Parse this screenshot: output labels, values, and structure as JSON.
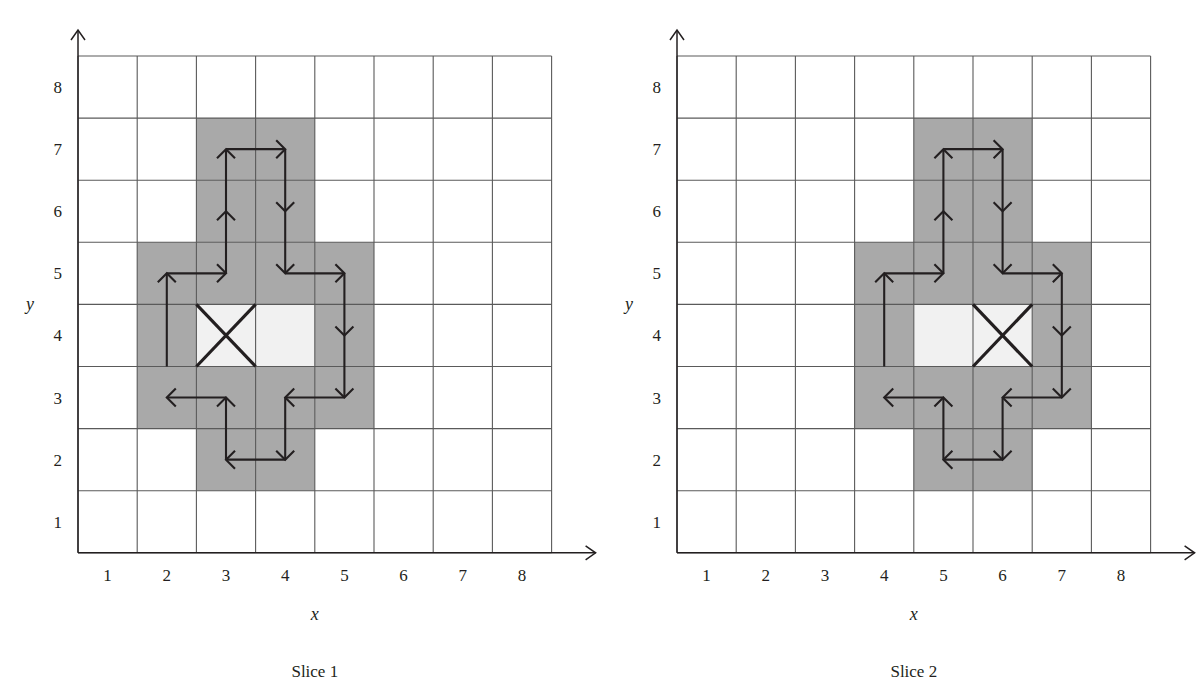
{
  "figure": {
    "background": "#ffffff",
    "ink": "#231f20",
    "shaded_color": "#a9a9a9",
    "light_color": "#f1f1f1",
    "grid_line_color": "#5a5a5a"
  },
  "panels": [
    {
      "id": "slice-1",
      "caption": "Slice 1",
      "axis": {
        "x_label": "x",
        "y_label": "y",
        "x_ticks": [
          "1",
          "2",
          "3",
          "4",
          "5",
          "6",
          "7",
          "8"
        ],
        "y_ticks": [
          "1",
          "2",
          "3",
          "4",
          "5",
          "6",
          "7",
          "8"
        ],
        "x_range": [
          0.5,
          8.5
        ],
        "y_range": [
          0.5,
          8.5
        ],
        "grid": true
      },
      "cells": {
        "shaded": [
          [
            3,
            7
          ],
          [
            4,
            7
          ],
          [
            3,
            6
          ],
          [
            4,
            6
          ],
          [
            2,
            5
          ],
          [
            3,
            5
          ],
          [
            4,
            5
          ],
          [
            5,
            5
          ],
          [
            2,
            4
          ],
          [
            5,
            4
          ],
          [
            2,
            3
          ],
          [
            3,
            3
          ],
          [
            4,
            3
          ],
          [
            5,
            3
          ],
          [
            3,
            2
          ],
          [
            4,
            2
          ]
        ],
        "light": [
          [
            3,
            4
          ],
          [
            4,
            4
          ]
        ],
        "marked_x": [
          [
            3,
            4
          ]
        ]
      },
      "arrows": [
        {
          "from": [
            2.0,
            3.5
          ],
          "to": [
            2.0,
            5.0
          ],
          "dir": "up"
        },
        {
          "from": [
            2.0,
            5.0
          ],
          "to": [
            3.0,
            5.0
          ],
          "dir": "right"
        },
        {
          "from": [
            3.0,
            5.0
          ],
          "to": [
            3.0,
            7.0
          ],
          "dir": "up"
        },
        {
          "from": [
            3.0,
            7.0
          ],
          "to": [
            4.0,
            7.0
          ],
          "dir": "right"
        },
        {
          "from": [
            4.0,
            7.0
          ],
          "to": [
            4.0,
            5.0
          ],
          "dir": "down"
        },
        {
          "from": [
            4.0,
            5.0
          ],
          "to": [
            5.0,
            5.0
          ],
          "dir": "right"
        },
        {
          "from": [
            5.0,
            5.0
          ],
          "to": [
            5.0,
            3.0
          ],
          "dir": "down"
        },
        {
          "from": [
            5.0,
            3.0
          ],
          "to": [
            4.0,
            3.0
          ],
          "dir": "left"
        },
        {
          "from": [
            4.0,
            3.0
          ],
          "to": [
            4.0,
            2.0
          ],
          "dir": "down"
        },
        {
          "from": [
            4.0,
            2.0
          ],
          "to": [
            3.0,
            2.0
          ],
          "dir": "left"
        },
        {
          "from": [
            3.0,
            2.0
          ],
          "to": [
            3.0,
            3.0
          ],
          "dir": "up"
        },
        {
          "from": [
            3.0,
            3.0
          ],
          "to": [
            2.0,
            3.0
          ],
          "dir": "left"
        }
      ]
    },
    {
      "id": "slice-2",
      "caption": "Slice 2",
      "axis": {
        "x_label": "x",
        "y_label": "y",
        "x_ticks": [
          "1",
          "2",
          "3",
          "4",
          "5",
          "6",
          "7",
          "8"
        ],
        "y_ticks": [
          "1",
          "2",
          "3",
          "4",
          "5",
          "6",
          "7",
          "8"
        ],
        "x_range": [
          0.5,
          8.5
        ],
        "y_range": [
          0.5,
          8.5
        ],
        "grid": true
      },
      "cells": {
        "shaded": [
          [
            5,
            7
          ],
          [
            6,
            7
          ],
          [
            5,
            6
          ],
          [
            6,
            6
          ],
          [
            4,
            5
          ],
          [
            5,
            5
          ],
          [
            6,
            5
          ],
          [
            7,
            5
          ],
          [
            4,
            4
          ],
          [
            7,
            4
          ],
          [
            4,
            3
          ],
          [
            5,
            3
          ],
          [
            6,
            3
          ],
          [
            7,
            3
          ],
          [
            5,
            2
          ],
          [
            6,
            2
          ]
        ],
        "light": [
          [
            5,
            4
          ],
          [
            6,
            4
          ]
        ],
        "marked_x": [
          [
            6,
            4
          ]
        ]
      },
      "arrows": [
        {
          "from": [
            4.0,
            3.5
          ],
          "to": [
            4.0,
            5.0
          ],
          "dir": "up"
        },
        {
          "from": [
            4.0,
            5.0
          ],
          "to": [
            5.0,
            5.0
          ],
          "dir": "right"
        },
        {
          "from": [
            5.0,
            5.0
          ],
          "to": [
            5.0,
            7.0
          ],
          "dir": "up"
        },
        {
          "from": [
            5.0,
            7.0
          ],
          "to": [
            6.0,
            7.0
          ],
          "dir": "right"
        },
        {
          "from": [
            6.0,
            7.0
          ],
          "to": [
            6.0,
            5.0
          ],
          "dir": "down"
        },
        {
          "from": [
            6.0,
            5.0
          ],
          "to": [
            7.0,
            5.0
          ],
          "dir": "right"
        },
        {
          "from": [
            7.0,
            5.0
          ],
          "to": [
            7.0,
            3.0
          ],
          "dir": "down"
        },
        {
          "from": [
            7.0,
            3.0
          ],
          "to": [
            6.0,
            3.0
          ],
          "dir": "left"
        },
        {
          "from": [
            6.0,
            3.0
          ],
          "to": [
            6.0,
            2.0
          ],
          "dir": "down"
        },
        {
          "from": [
            6.0,
            2.0
          ],
          "to": [
            5.0,
            2.0
          ],
          "dir": "left"
        },
        {
          "from": [
            5.0,
            2.0
          ],
          "to": [
            5.0,
            3.0
          ],
          "dir": "up"
        },
        {
          "from": [
            5.0,
            3.0
          ],
          "to": [
            4.0,
            3.0
          ],
          "dir": "left"
        }
      ]
    }
  ],
  "chart_data": {
    "type": "heatmap",
    "title": "",
    "subtitle": "",
    "xlabel": "x",
    "ylabel": "y",
    "xlim": [
      0.5,
      8.5
    ],
    "ylim": [
      0.5,
      8.5
    ],
    "grid": true,
    "legend_position": "none",
    "categories_x": [
      1,
      2,
      3,
      4,
      5,
      6,
      7,
      8
    ],
    "categories_y": [
      1,
      2,
      3,
      4,
      5,
      6,
      7,
      8
    ],
    "value_legend": {
      "0": "empty (white)",
      "1": "neighbourhood (grey)",
      "2": "centre (light)"
    },
    "series": [
      {
        "name": "Slice 1",
        "values": [
          [
            0,
            0,
            0,
            0,
            0,
            0,
            0,
            0
          ],
          [
            0,
            0,
            1,
            1,
            0,
            0,
            0,
            0
          ],
          [
            0,
            1,
            1,
            1,
            1,
            0,
            0,
            0
          ],
          [
            0,
            1,
            2,
            2,
            1,
            0,
            0,
            0
          ],
          [
            0,
            1,
            1,
            1,
            1,
            0,
            0,
            0
          ],
          [
            0,
            0,
            1,
            1,
            0,
            0,
            0,
            0
          ],
          [
            0,
            0,
            1,
            1,
            0,
            0,
            0,
            0
          ],
          [
            0,
            0,
            0,
            0,
            0,
            0,
            0,
            0
          ]
        ],
        "marked_x_cell": [
          3,
          4
        ],
        "path": [
          [
            2,
            3.5
          ],
          [
            2,
            5
          ],
          [
            3,
            5
          ],
          [
            3,
            7
          ],
          [
            4,
            7
          ],
          [
            4,
            5
          ],
          [
            5,
            5
          ],
          [
            5,
            3
          ],
          [
            4,
            3
          ],
          [
            4,
            2
          ],
          [
            3,
            2
          ],
          [
            3,
            3
          ],
          [
            2,
            3
          ]
        ]
      },
      {
        "name": "Slice 2",
        "values": [
          [
            0,
            0,
            0,
            0,
            0,
            0,
            0,
            0
          ],
          [
            0,
            0,
            0,
            0,
            1,
            1,
            0,
            0
          ],
          [
            0,
            0,
            0,
            1,
            1,
            1,
            1,
            0
          ],
          [
            0,
            0,
            0,
            1,
            2,
            2,
            1,
            0
          ],
          [
            0,
            0,
            0,
            1,
            1,
            1,
            1,
            0
          ],
          [
            0,
            0,
            0,
            0,
            1,
            1,
            0,
            0
          ],
          [
            0,
            0,
            0,
            0,
            1,
            1,
            0,
            0
          ],
          [
            0,
            0,
            0,
            0,
            0,
            0,
            0,
            0
          ]
        ],
        "marked_x_cell": [
          6,
          4
        ],
        "path": [
          [
            4,
            3.5
          ],
          [
            4,
            5
          ],
          [
            5,
            5
          ],
          [
            5,
            7
          ],
          [
            6,
            7
          ],
          [
            6,
            5
          ],
          [
            7,
            5
          ],
          [
            7,
            3
          ],
          [
            6,
            3
          ],
          [
            6,
            2
          ],
          [
            5,
            2
          ],
          [
            5,
            3
          ],
          [
            4,
            3
          ]
        ]
      }
    ]
  }
}
